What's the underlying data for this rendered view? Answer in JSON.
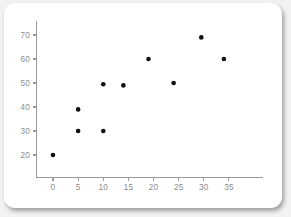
{
  "card": {
    "background_color": "#ffffff",
    "page_background_color": "#f2f2f2"
  },
  "chart_data": {
    "type": "scatter",
    "title": "",
    "subtitle": "",
    "xlabel": "",
    "ylabel": "",
    "legend": [],
    "legend_position": "none",
    "grid": false,
    "axis_color": "#9a9a9a",
    "tick_label_color": "#8c8c8c",
    "point_color": "#111111",
    "point_radius": 2.3,
    "xlim": [
      -3,
      46
    ],
    "ylim": [
      14,
      76
    ],
    "xticks": [
      0,
      5,
      10,
      15,
      20,
      25,
      30,
      35
    ],
    "xtick_labels": [
      "0",
      "5",
      "10",
      "15",
      "20",
      "25",
      "30",
      "35"
    ],
    "yticks": [
      20,
      30,
      40,
      50,
      60,
      70
    ],
    "ytick_labels": [
      "20",
      "30",
      "40",
      "50",
      "60",
      "70"
    ],
    "series": [
      {
        "name": "series-1",
        "points": [
          {
            "x": 0,
            "y": 20
          },
          {
            "x": 5,
            "y": 30
          },
          {
            "x": 5,
            "y": 39
          },
          {
            "x": 10,
            "y": 30
          },
          {
            "x": 10,
            "y": 49.5
          },
          {
            "x": 14,
            "y": 49
          },
          {
            "x": 19,
            "y": 60
          },
          {
            "x": 24,
            "y": 50
          },
          {
            "x": 29.5,
            "y": 69
          },
          {
            "x": 34,
            "y": 60
          }
        ]
      }
    ]
  }
}
